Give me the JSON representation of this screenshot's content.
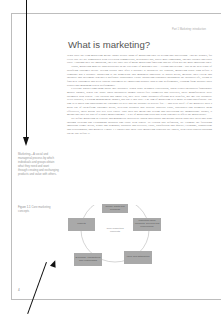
{
  "page": {
    "running_head": "Part 1 Marketing: introduction",
    "title": "What is marketing?",
    "paragraphs": [
      "What does the term marketing mean? Many people think of marketing only as selling and advertising. And no wonder, for every day we are bombarded with television commercials, newspaper ads, direct mail campaigns, Internet pitches and sales calls. Although they are important, they are only two of many marketing functions and are often not the most important ones.",
      "Today, marketing must be understood not in the old sense of making a sale – 'telling and selling' – but in the new sense of satisfying customer needs. Selling occurs only after a product is produced. By contrast, marketing starts long before a company has a product. Marketing is the homework that managers undertake to assess needs, measure their extent and intensity and determine whether a profitable opportunity exists. Marketing continues throughout the product's life, trying to find new customers and keep current customers by improving product appeal and performance, learning from product sales results and managing repeat performance.",
      "Everyone knows something about 'hot' products. When Sony designed PlayStation, when Nokia introduced fashionable mobile phones, when The Body Shop introduced animal cruelty-free cosmetics and toiletries, these manufacturers were swamped with orders. Also Swatch and Smart Car, they were 'right' products offering new benefits, not 'me too' products. Peter Drucker, a leading management thinker, has put it this way: 'The aim of marketing is to make selling superfluous. The aim is to know and understand the customer so well that the product or service fits … and sells itself.' If the marketer does a good job of identifying customer needs, develops products that provide superior value, distributes and promotes them effectively, these goods will sell very easily. This does not mean that selling and advertising are unimportant. Rather, it means that they are part of a larger marketing mix – a set of marketing tools that work together to affect the marketplace.",
      "We define marketing as a social and managerial process by which individuals and groups obtain what they need and want through creating and exchanging products and value with others. To explain this definition, we examine the following important terms: needs, wants and demands; products and services; value, satisfaction and quality; exchange, transactions and relationships; and markets. Figure 1.1 shows that these core marketing concepts are linked, with each concept building on the one before it."
    ],
    "margin_definition": "Marketing—A social and managerial process by which individuals and groups obtain what they need and want through creating and exchanging products and value with others.",
    "figure_caption": {
      "number": "Figure 1.1",
      "text": "Core marketing concepts"
    },
    "folio": "4"
  },
  "diagram": {
    "center_label": "Core marketing concepts",
    "nodes": [
      "Needs, wants and demands",
      "Marketing offers (products, services and experiences)",
      "Value and satisfaction",
      "Exchange, transactions and relationships",
      "Markets"
    ]
  }
}
